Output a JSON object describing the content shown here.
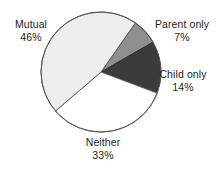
{
  "chart_data": {
    "type": "pie",
    "title": "",
    "subtitle": "",
    "xlabel": "",
    "ylabel": "",
    "grid": false,
    "legend_position": "none",
    "label_format": "name-over-percent",
    "units": "percent",
    "total": 100,
    "start_angle_deg": -55,
    "direction": "clockwise",
    "categories": [
      "Parent only",
      "Child only",
      "Neither",
      "Mutual"
    ],
    "values": [
      7,
      14,
      33,
      46
    ],
    "slices": [
      {
        "name": "Parent only",
        "value": 7,
        "percent_text": "7%",
        "fill": "#8f8f8f",
        "stroke": "#3a3a3a"
      },
      {
        "name": "Child only",
        "value": 14,
        "percent_text": "14%",
        "fill": "#3b3b3b",
        "stroke": "#2a2a2a"
      },
      {
        "name": "Neither",
        "value": 33,
        "percent_text": "33%",
        "fill": "#ffffff",
        "stroke": "#565656"
      },
      {
        "name": "Mutual",
        "value": 46,
        "percent_text": "46%",
        "fill": "#ededed",
        "stroke": "#565656"
      }
    ]
  },
  "labels": {
    "mutual": {
      "name": "Mutual",
      "value": "46%"
    },
    "parent_only": {
      "name": "Parent only",
      "value": "7%"
    },
    "child_only": {
      "name": "Child only",
      "value": "14%"
    },
    "neither": {
      "name": "Neither",
      "value": "33%"
    }
  },
  "geometry": {
    "center_x": 101,
    "center_y": 72,
    "radius": 60
  },
  "colors": {
    "background": "#ffffff",
    "text": "#1d1d1d",
    "outline": "#565656",
    "slice_light": "#ededed",
    "slice_white": "#ffffff",
    "slice_grey": "#8f8f8f",
    "slice_dark": "#3b3b3b"
  }
}
